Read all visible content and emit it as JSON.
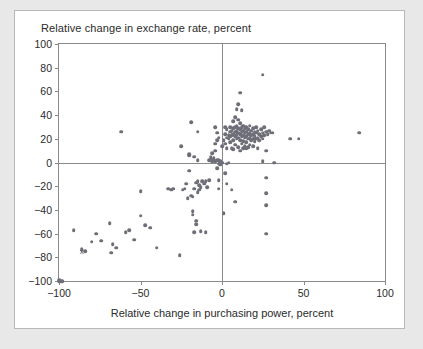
{
  "card": {
    "background": "#ffffff",
    "page_background": "#e8e8e8"
  },
  "chart_data": {
    "type": "scatter",
    "title": "Relative change in exchange rate, percent",
    "xlabel": "Relative change in purchasing power, percent",
    "ylabel": "Relative change in exchange rate, percent",
    "xlim": [
      -100,
      100
    ],
    "ylim": [
      -100,
      100
    ],
    "xticks": [
      -100,
      -50,
      0,
      50,
      100
    ],
    "yticks": [
      -100,
      -80,
      -60,
      -40,
      -20,
      0,
      20,
      40,
      60,
      80,
      100
    ],
    "xticklabels": [
      "−100",
      "−50",
      "0",
      "50",
      "100"
    ],
    "yticklabels": [
      "−100",
      "−80",
      "−60",
      "−40",
      "−20",
      "0",
      "20",
      "40",
      "60",
      "80",
      "100"
    ],
    "grid": false,
    "legend": null,
    "marker_color": "#6e6e78",
    "axis_color": "#8a8a8a",
    "annotations": [
      {
        "text": "x",
        "x": -86,
        "y": -75
      }
    ],
    "points": [
      [
        -100,
        -100
      ],
      [
        -99,
        -100
      ],
      [
        -98,
        -100
      ],
      [
        -100,
        -99
      ],
      [
        -91,
        -57
      ],
      [
        -86,
        -73
      ],
      [
        -84,
        -75
      ],
      [
        -80,
        -67
      ],
      [
        -77,
        -60
      ],
      [
        -74,
        -66
      ],
      [
        -69,
        -51
      ],
      [
        -68,
        -76
      ],
      [
        -67,
        -69
      ],
      [
        -65,
        -72
      ],
      [
        -62,
        26
      ],
      [
        -59,
        -59
      ],
      [
        -57,
        -57
      ],
      [
        -54,
        -65
      ],
      [
        -50,
        -24
      ],
      [
        -50,
        -45
      ],
      [
        -47,
        -53
      ],
      [
        -44,
        -55
      ],
      [
        -40,
        -72
      ],
      [
        -33,
        -22
      ],
      [
        -31,
        -23
      ],
      [
        -30,
        -22
      ],
      [
        -26,
        -78
      ],
      [
        -25,
        14
      ],
      [
        -24,
        -23
      ],
      [
        -23,
        -22
      ],
      [
        -22,
        -18
      ],
      [
        -21,
        -30
      ],
      [
        -20,
        7
      ],
      [
        -20,
        6
      ],
      [
        -20,
        -7
      ],
      [
        -19,
        34
      ],
      [
        -19,
        -28
      ],
      [
        -18,
        -29
      ],
      [
        -18,
        -41
      ],
      [
        -18,
        -44
      ],
      [
        -17,
        -22
      ],
      [
        -17,
        -59
      ],
      [
        -17,
        5
      ],
      [
        -16,
        -17
      ],
      [
        -16,
        -49
      ],
      [
        -16,
        -52
      ],
      [
        -15,
        26
      ],
      [
        -15,
        2
      ],
      [
        -15,
        -16
      ],
      [
        -15,
        -25
      ],
      [
        -14,
        -19
      ],
      [
        -14,
        -23
      ],
      [
        -13,
        -21
      ],
      [
        -13,
        -58
      ],
      [
        -12,
        -16
      ],
      [
        -11,
        -18
      ],
      [
        -10,
        -16
      ],
      [
        -10,
        -59
      ],
      [
        -9,
        -21
      ],
      [
        -8,
        -15
      ],
      [
        -8,
        2
      ],
      [
        -7,
        5
      ],
      [
        -7,
        3
      ],
      [
        -6,
        1
      ],
      [
        -6,
        8
      ],
      [
        -5,
        4
      ],
      [
        -5,
        2
      ],
      [
        -5,
        3
      ],
      [
        -4,
        30
      ],
      [
        -4,
        16
      ],
      [
        -4,
        10
      ],
      [
        -4,
        1
      ],
      [
        -3,
        25
      ],
      [
        -3,
        19
      ],
      [
        -3,
        2
      ],
      [
        -3,
        -5
      ],
      [
        -2,
        21
      ],
      [
        -2,
        2
      ],
      [
        -2,
        -1
      ],
      [
        -2,
        -15
      ],
      [
        -2,
        -22
      ],
      [
        -1,
        1
      ],
      [
        -1,
        0
      ],
      [
        -1,
        -2
      ],
      [
        0,
        14
      ],
      [
        0,
        0
      ],
      [
        1,
        19
      ],
      [
        1,
        -43
      ],
      [
        2,
        30
      ],
      [
        2,
        24
      ],
      [
        2,
        16
      ],
      [
        2,
        -9
      ],
      [
        3,
        28
      ],
      [
        3,
        21
      ],
      [
        3,
        12
      ],
      [
        3,
        -1
      ],
      [
        3,
        -18
      ],
      [
        4,
        23
      ],
      [
        4,
        20
      ],
      [
        4,
        0
      ],
      [
        5,
        30
      ],
      [
        5,
        26
      ],
      [
        5,
        22
      ],
      [
        5,
        17
      ],
      [
        6,
        27
      ],
      [
        6,
        23
      ],
      [
        6,
        12
      ],
      [
        6,
        -23
      ],
      [
        7,
        35
      ],
      [
        7,
        29
      ],
      [
        7,
        24
      ],
      [
        7,
        19
      ],
      [
        7,
        11
      ],
      [
        8,
        38
      ],
      [
        8,
        30
      ],
      [
        8,
        26
      ],
      [
        8,
        22
      ],
      [
        8,
        15
      ],
      [
        8,
        -33
      ],
      [
        9,
        45
      ],
      [
        9,
        31
      ],
      [
        9,
        27
      ],
      [
        9,
        24
      ],
      [
        9,
        20
      ],
      [
        10,
        49
      ],
      [
        10,
        36
      ],
      [
        10,
        29
      ],
      [
        10,
        25
      ],
      [
        10,
        21
      ],
      [
        10,
        13
      ],
      [
        11,
        59
      ],
      [
        11,
        33
      ],
      [
        11,
        28
      ],
      [
        11,
        24
      ],
      [
        11,
        19
      ],
      [
        11,
        10
      ],
      [
        12,
        44
      ],
      [
        12,
        30
      ],
      [
        12,
        26
      ],
      [
        12,
        22
      ],
      [
        12,
        16
      ],
      [
        13,
        31
      ],
      [
        13,
        27
      ],
      [
        13,
        23
      ],
      [
        13,
        18
      ],
      [
        13,
        12
      ],
      [
        14,
        29
      ],
      [
        14,
        25
      ],
      [
        14,
        21
      ],
      [
        14,
        14
      ],
      [
        15,
        30
      ],
      [
        15,
        26
      ],
      [
        15,
        22
      ],
      [
        15,
        17
      ],
      [
        15,
        12
      ],
      [
        16,
        28
      ],
      [
        16,
        24
      ],
      [
        16,
        20
      ],
      [
        16,
        13
      ],
      [
        17,
        31
      ],
      [
        17,
        25
      ],
      [
        17,
        21
      ],
      [
        17,
        15
      ],
      [
        18,
        27
      ],
      [
        18,
        23
      ],
      [
        18,
        19
      ],
      [
        19,
        29
      ],
      [
        19,
        24
      ],
      [
        19,
        20
      ],
      [
        19,
        14
      ],
      [
        20,
        26
      ],
      [
        20,
        22
      ],
      [
        20,
        18
      ],
      [
        21,
        30
      ],
      [
        21,
        25
      ],
      [
        21,
        20
      ],
      [
        22,
        27
      ],
      [
        22,
        21
      ],
      [
        22,
        12
      ],
      [
        23,
        24
      ],
      [
        23,
        19
      ],
      [
        24,
        28
      ],
      [
        24,
        22
      ],
      [
        25,
        74
      ],
      [
        25,
        25
      ],
      [
        25,
        20
      ],
      [
        25,
        1
      ],
      [
        26,
        30
      ],
      [
        26,
        23
      ],
      [
        27,
        26
      ],
      [
        27,
        10
      ],
      [
        27,
        -13
      ],
      [
        27,
        -26
      ],
      [
        27,
        -36
      ],
      [
        27,
        -60
      ],
      [
        28,
        24
      ],
      [
        29,
        27
      ],
      [
        30,
        25
      ],
      [
        31,
        25
      ],
      [
        32,
        0
      ],
      [
        42,
        20
      ],
      [
        47,
        20
      ],
      [
        84,
        25
      ]
    ]
  }
}
